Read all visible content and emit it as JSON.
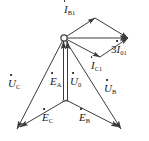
{
  "figure": {
    "background_color": "#ffffff",
    "stroke_color": "#3c3c3c",
    "label_color": "#1a1a1a",
    "width": 149,
    "height": 141
  },
  "nodes": {
    "origin": {
      "name": "origin-node",
      "x": 64,
      "y": 38,
      "marker": "open-circle"
    },
    "neutral": {
      "name": "neutral-point",
      "x": 66,
      "y": 100
    },
    "rhombus_top": {
      "x": 95,
      "y": 18
    },
    "rhombus_right": {
      "x": 128,
      "y": 38
    },
    "rhombus_bottom": {
      "x": 100,
      "y": 57
    },
    "uc_tip": {
      "x": 17,
      "y": 129
    },
    "ub_tip": {
      "x": 121,
      "y": 129
    },
    "ec_tip": {
      "x": 20,
      "y": 127
    },
    "eb_tip": {
      "x": 119,
      "y": 127
    }
  },
  "labels": {
    "i_b1": {
      "name": "label-i-b1",
      "base": "I",
      "sub": "B1",
      "coef": "",
      "overdot": true,
      "x": 64,
      "y": 4
    },
    "i_c1": {
      "name": "label-i-c1",
      "base": "I",
      "sub": "C1",
      "coef": "",
      "overdot": true,
      "x": 91,
      "y": 60
    },
    "i_01": {
      "name": "label-3i-01",
      "base": "I",
      "sub": "01",
      "coef": "3",
      "overdot": true,
      "x": 111,
      "y": 44
    },
    "u_c": {
      "name": "label-u-c",
      "base": "U",
      "sub": "C",
      "coef": "",
      "overdot": true,
      "x": 8,
      "y": 78
    },
    "u_0": {
      "name": "label-u-0",
      "base": "U",
      "sub": "0",
      "coef": "",
      "overdot": true,
      "x": 70,
      "y": 76
    },
    "u_b": {
      "name": "label-u-b",
      "base": "U",
      "sub": "B",
      "coef": "",
      "overdot": true,
      "x": 104,
      "y": 83
    },
    "e_a": {
      "name": "label-e-a",
      "base": "E",
      "sub": "A",
      "coef": "",
      "overdot": true,
      "x": 50,
      "y": 76
    },
    "e_c": {
      "name": "label-e-c",
      "base": "E",
      "sub": "C",
      "coef": "",
      "overdot": true,
      "x": 42,
      "y": 112
    },
    "e_b": {
      "name": "label-e-b",
      "base": "E",
      "sub": "B",
      "coef": "",
      "overdot": true,
      "x": 79,
      "y": 112
    }
  },
  "vectors": [
    {
      "name": "vector-i-b1",
      "from": "origin",
      "to": "rhombus_top",
      "arrow": "end"
    },
    {
      "name": "vector-i-c1",
      "from": "origin",
      "to": "rhombus_bottom",
      "arrow": "end"
    },
    {
      "name": "vector-3i-01",
      "from": "origin",
      "to": "rhombus_right",
      "arrow": "end"
    },
    {
      "name": "vector-rhombus-top-right",
      "from": "rhombus_top",
      "to": "rhombus_right",
      "arrow": "end"
    },
    {
      "name": "vector-rhombus-bottom-right",
      "from": "rhombus_bottom",
      "to": "rhombus_right",
      "arrow": "end"
    },
    {
      "name": "vector-u-c",
      "from": "origin",
      "to": "uc_tip",
      "arrow": "end"
    },
    {
      "name": "vector-u-b",
      "from": "origin",
      "to": "ub_tip",
      "arrow": "end"
    },
    {
      "name": "vector-u-0",
      "from": "neutral",
      "to": "origin",
      "arrow": "end"
    },
    {
      "name": "vector-e-a",
      "from": "neutral",
      "to": "origin",
      "arrow": "end"
    },
    {
      "name": "vector-e-c",
      "from": "neutral",
      "to": "ec_tip",
      "arrow": "end"
    },
    {
      "name": "vector-e-b",
      "from": "neutral",
      "to": "eb_tip",
      "arrow": "end"
    }
  ]
}
